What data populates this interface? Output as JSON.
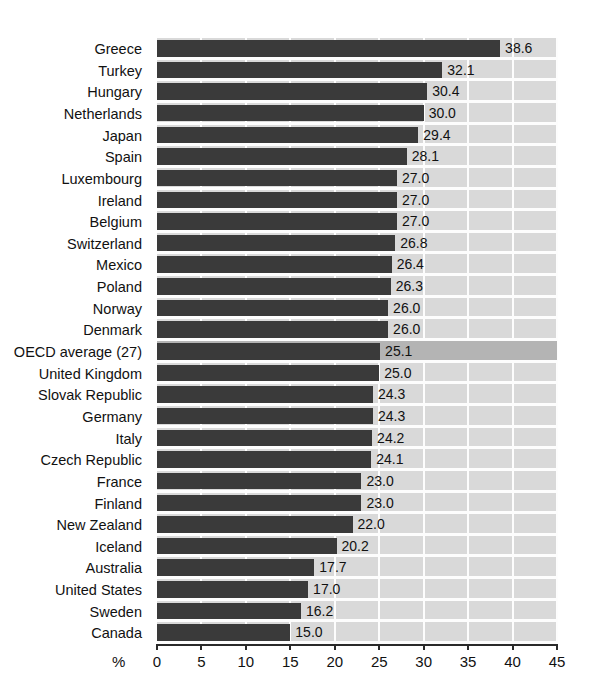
{
  "chart_data": {
    "type": "bar",
    "orientation": "horizontal",
    "title": "",
    "xlabel": "%",
    "ylabel": "",
    "xlim": [
      0,
      45
    ],
    "xticks": [
      0,
      5,
      10,
      15,
      20,
      25,
      30,
      35,
      40,
      45
    ],
    "grid": "vertical white gridlines at each x tick",
    "legend": "none",
    "highlight_category": "OECD average (27)",
    "categories": [
      "Greece",
      "Turkey",
      "Hungary",
      "Netherlands",
      "Japan",
      "Spain",
      "Luxembourg",
      "Ireland",
      "Belgium",
      "Switzerland",
      "Mexico",
      "Poland",
      "Norway",
      "Denmark",
      "OECD average (27)",
      "United Kingdom",
      "Slovak Republic",
      "Germany",
      "Italy",
      "Czech Republic",
      "France",
      "Finland",
      "New Zealand",
      "Iceland",
      "Australia",
      "United States",
      "Sweden",
      "Canada"
    ],
    "values": [
      38.6,
      32.1,
      30.4,
      30.0,
      29.4,
      28.1,
      27.0,
      27.0,
      27.0,
      26.8,
      26.4,
      26.3,
      26.0,
      26.0,
      25.1,
      25.0,
      24.3,
      24.3,
      24.2,
      24.1,
      23.0,
      23.0,
      22.0,
      20.2,
      17.7,
      17.0,
      16.2,
      15.0
    ],
    "value_labels": [
      "38.6",
      "32.1",
      "30.4",
      "30.0",
      "29.4",
      "28.1",
      "27.0",
      "27.0",
      "27.0",
      "26.8",
      "26.4",
      "26.3",
      "26.0",
      "26.0",
      "25.1",
      "25.0",
      "24.3",
      "24.3",
      "24.2",
      "24.1",
      "23.0",
      "23.0",
      "22.0",
      "20.2",
      "17.7",
      "17.0",
      "16.2",
      "15.0"
    ],
    "colors": {
      "bar": "#3a3a3a",
      "plot_background": "#d9d9d9",
      "highlight_row_background": "#b4b4b4",
      "gridline": "#fdfdfd",
      "axis": "#2a2a2a",
      "text": "#111111"
    }
  }
}
